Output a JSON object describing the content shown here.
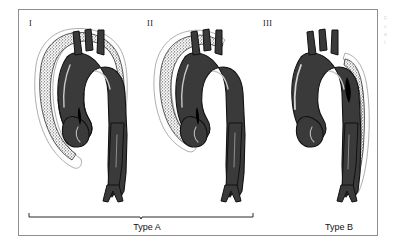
{
  "figure": {
    "kind": "medical-illustration",
    "frame_border_color": "#8e8e8e",
    "background_color": "#ffffff"
  },
  "edge_caption": {
    "lines": [
      "F",
      "c",
      "a",
      "t"
    ]
  },
  "panels": [
    {
      "numeral": "I",
      "name": "panel-one",
      "dissection_region": "ascending-arch-and-descending",
      "vessel_color": "#3a3a3a",
      "vessel_outline_color": "#111111",
      "dissection_fill": "stipple",
      "highlight_color": "#d9d9d9"
    },
    {
      "numeral": "II",
      "name": "panel-two",
      "dissection_region": "ascending-only",
      "vessel_color": "#3a3a3a",
      "vessel_outline_color": "#111111",
      "dissection_fill": "stipple",
      "highlight_color": "#d9d9d9"
    },
    {
      "numeral": "III",
      "name": "panel-three",
      "dissection_region": "descending-only",
      "vessel_color": "#3a3a3a",
      "vessel_outline_color": "#111111",
      "dissection_fill": "stipple",
      "highlight_color": "#d9d9d9"
    }
  ],
  "labels": {
    "type_a": "Type A",
    "type_b": "Type B"
  }
}
